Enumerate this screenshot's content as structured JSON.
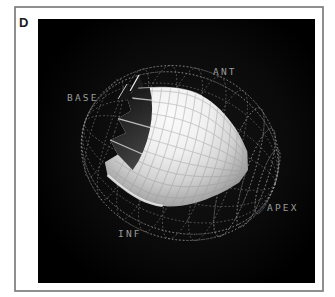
{
  "figure": {
    "panel_label": "D",
    "labels": {
      "base": "BASE",
      "ant": "ANT",
      "apex": "APEX",
      "inf": "INF"
    },
    "colors": {
      "page_bg": "#ffffff",
      "frame_border": "#7c7c7c",
      "render_bg_center": "#161616",
      "render_bg_edge": "#000000",
      "panel_label": "#1b1b1b",
      "anatomy_label": "#9b9b9b",
      "mesh_line": "#787878",
      "mesh_line_bright": "#acacac",
      "surface_highlight": "#fbfbfb",
      "surface_mid": "#d2d2d2",
      "surface_shadow": "#575757",
      "cut_dark": "#080808",
      "cut_mid": "#3f3f3f",
      "cut_streak": "#e4e4e4",
      "rim_highlight": "#f2f2f2"
    }
  }
}
